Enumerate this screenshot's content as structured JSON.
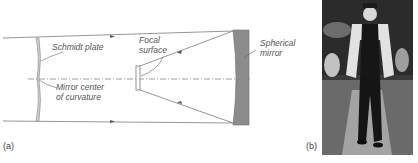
{
  "figure": {
    "panel_a": {
      "label": "(a)",
      "labels": {
        "schmidt_plate": "Schmidt plate",
        "mirror_center_line1": "Mirror center",
        "mirror_center_line2": "of curvature",
        "focal_line1": "Focal",
        "focal_line2": "surface",
        "spherical_line1": "Spherical",
        "spherical_line2": "mirror"
      }
    },
    "panel_b": {
      "label": "(b)",
      "content": "photograph of a man in a suit walking outdoors"
    },
    "colors": {
      "line": "#8a8a8a",
      "mirror_fill": "#8c8c8c",
      "text": "#555555"
    }
  }
}
